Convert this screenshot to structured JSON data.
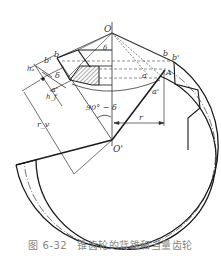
{
  "figure": {
    "number": "图 6-32",
    "title": "锥齿轮的背锥和当量齿轮"
  },
  "labels": {
    "apex": "O",
    "center": "O'",
    "delta_top": "δ",
    "delta_left": "δ",
    "angle": "90° − δ",
    "b_right": "b",
    "b_prime_right": "b'",
    "A": "A",
    "a_right": "a",
    "a_prime_right": "a'",
    "b_prime_left": "b'",
    "b_left": "b",
    "a_prime_left": "a'",
    "ha": "hₐ",
    "hf": "h_f",
    "rv": "r_v",
    "r": "r"
  },
  "colors": {
    "line": "#1a1a1a",
    "thin": "#444444",
    "hatch": "#555555",
    "caption": "#888888"
  }
}
